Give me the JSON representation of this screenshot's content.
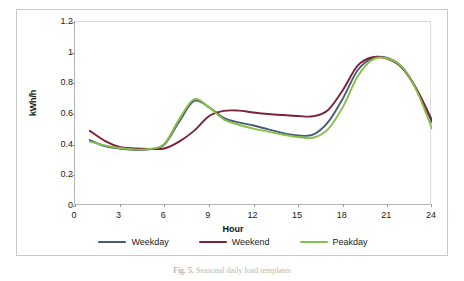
{
  "figure": {
    "caption_prefix": "Fig. 5.",
    "caption_text": "Seasonal daily load templates"
  },
  "chart_data": {
    "type": "line",
    "title": "",
    "xlabel": "Hour",
    "ylabel": "kWh/h",
    "xlim": [
      0,
      24
    ],
    "ylim": [
      0,
      1.2
    ],
    "grid": false,
    "legend_position": "bottom",
    "x_ticks": [
      "0",
      "3",
      "6",
      "9",
      "12",
      "15",
      "18",
      "21",
      "24"
    ],
    "y_ticks": [
      "0",
      "0.2",
      "0.4",
      "0.6",
      "0.8",
      "1",
      "1.2"
    ],
    "x": [
      1,
      2,
      3,
      4,
      5,
      6,
      7,
      8,
      9,
      10,
      11,
      12,
      13,
      14,
      15,
      16,
      17,
      18,
      19,
      20,
      21,
      22,
      23,
      24
    ],
    "series": [
      {
        "name": "Weekday",
        "color": "#4a5a78",
        "values": [
          0.43,
          0.39,
          0.375,
          0.365,
          0.37,
          0.4,
          0.55,
          0.685,
          0.645,
          0.575,
          0.545,
          0.525,
          0.5,
          0.475,
          0.46,
          0.465,
          0.545,
          0.7,
          0.885,
          0.965,
          0.965,
          0.905,
          0.755,
          0.545
        ]
      },
      {
        "name": "Weekend",
        "color": "#7d2239",
        "values": [
          0.49,
          0.425,
          0.385,
          0.375,
          0.372,
          0.375,
          0.42,
          0.49,
          0.585,
          0.62,
          0.622,
          0.61,
          0.6,
          0.593,
          0.587,
          0.585,
          0.625,
          0.755,
          0.915,
          0.97,
          0.96,
          0.9,
          0.755,
          0.56
        ]
      },
      {
        "name": "Peakday",
        "color": "#86c04a",
        "values": [
          0.42,
          0.395,
          0.378,
          0.368,
          0.372,
          0.405,
          0.565,
          0.695,
          0.645,
          0.565,
          0.53,
          0.505,
          0.485,
          0.465,
          0.45,
          0.445,
          0.5,
          0.645,
          0.845,
          0.955,
          0.962,
          0.905,
          0.745,
          0.505
        ]
      }
    ]
  }
}
